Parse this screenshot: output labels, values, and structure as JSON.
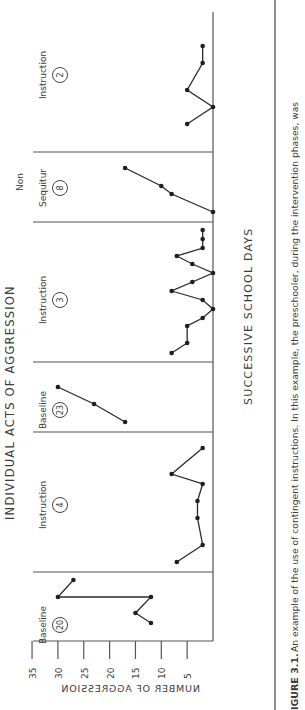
{
  "figure": {
    "title": "INDIVIDUAL ACTS OF AGGRESSION",
    "caption_label": "IGURE 3.1.",
    "caption_text_line1": "An example of the use of contingent instructions. In this example, the preschooler, during the intervention phases, was",
    "orientation": "rotated 90° counter-clockwise (page viewed sideways)"
  },
  "chart_data": {
    "type": "line",
    "title": "INDIVIDUAL ACTS OF AGGRESSION",
    "xlabel": "SUCCESSIVE SCHOOL DAYS",
    "ylabel": "NUMBER OF AGGRESSION",
    "ylim": [
      0,
      35
    ],
    "yticks": [
      35,
      30,
      25,
      20,
      15,
      10,
      5
    ],
    "grid": false,
    "legend": "none",
    "phases": [
      {
        "label": "Baseline",
        "condition_number": "20",
        "values": [
          12,
          15,
          12,
          30,
          27
        ]
      },
      {
        "label": "Instruction",
        "condition_number": "4",
        "values": [
          7,
          2,
          3,
          3,
          2,
          8,
          2
        ]
      },
      {
        "label": "Baseline",
        "condition_number": "23",
        "values": [
          17,
          23,
          30
        ]
      },
      {
        "label": "Instruction",
        "condition_number": "3",
        "values": [
          8,
          5,
          5,
          2,
          0,
          2,
          8,
          4,
          0,
          4,
          7,
          2,
          2,
          2
        ]
      },
      {
        "label": "Non Sequitur",
        "label_line1": "Non",
        "label_line2": "Sequitur",
        "condition_number": "8",
        "values": [
          0,
          8,
          10,
          17
        ]
      },
      {
        "label": "Instruction",
        "condition_number": "2",
        "values": [
          5,
          0,
          5,
          2,
          2
        ]
      }
    ]
  },
  "layout": {
    "axis_zero_x": 213,
    "px_per_unit": 5.17,
    "plot_top_x": 33,
    "axis_bottom_y": 641,
    "axis_top_y": 12,
    "dividers_y": [
      572,
      432,
      362,
      222,
      152
    ],
    "phase_point_y": [
      [
        623,
        613,
        597,
        597,
        580
      ],
      [
        562,
        545,
        518,
        501,
        484,
        474,
        448
      ],
      [
        422,
        404,
        387
      ],
      [
        353,
        343,
        326,
        318,
        309,
        300,
        291,
        282,
        273,
        264,
        256,
        248,
        239,
        230
      ],
      [
        212,
        194,
        186,
        168
      ],
      [
        124,
        107,
        90,
        63,
        46
      ]
    ],
    "phase_label_y": [
      625,
      505,
      410,
      300,
      188,
      75
    ]
  }
}
